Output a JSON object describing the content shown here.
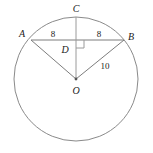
{
  "diagram": {
    "type": "circle-geometry",
    "background_color": "#ffffff",
    "stroke_color": "#8a8a8a",
    "text_color": "#1a1a1a",
    "circle": {
      "name": "circle-O",
      "center_label": "O",
      "center": {
        "x": 76,
        "y": 79
      },
      "radius": 62
    },
    "points": [
      {
        "id": "A",
        "label": "A",
        "x": 31,
        "y": 40,
        "label_x": 22,
        "label_y": 37
      },
      {
        "id": "B",
        "label": "B",
        "x": 124,
        "y": 40,
        "label_x": 129,
        "label_y": 38
      },
      {
        "id": "C",
        "label": "C",
        "x": 76,
        "y": 17,
        "label_x": 73,
        "label_y": 12
      },
      {
        "id": "D",
        "label": "D",
        "x": 76,
        "y": 40,
        "label_x": 62,
        "label_y": 52
      },
      {
        "id": "O",
        "label": "O",
        "x": 76,
        "y": 79,
        "label_x": 72,
        "label_y": 93
      }
    ],
    "segments": [
      {
        "id": "AB",
        "from": "A",
        "to": "B",
        "kind": "chord"
      },
      {
        "id": "CO",
        "from": "C",
        "to": "O",
        "kind": "radius-vertical"
      },
      {
        "id": "AO",
        "from": "A",
        "to": "O",
        "kind": "radius"
      },
      {
        "id": "BO",
        "from": "B",
        "to": "O",
        "kind": "radius"
      }
    ],
    "measures": [
      {
        "id": "AD",
        "value": "8",
        "x": 53,
        "y": 36,
        "segment": "AD"
      },
      {
        "id": "DB",
        "value": "8",
        "x": 99,
        "y": 36,
        "segment": "DB"
      },
      {
        "id": "OB",
        "value": "10",
        "x": 103,
        "y": 68,
        "segment": "OB"
      }
    ],
    "right_angle": {
      "name": "right-angle-at-D",
      "at_point": "D",
      "size": 8,
      "orientation": "lower-right"
    }
  }
}
